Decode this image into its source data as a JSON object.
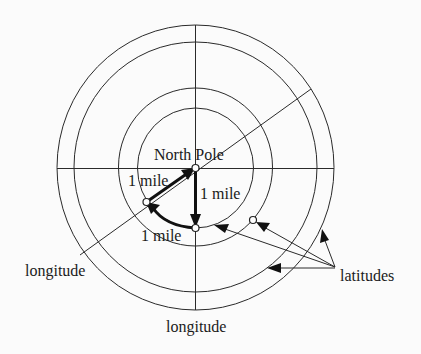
{
  "diagram": {
    "labels": {
      "north_pole": "North Pole",
      "segment_left": "1 mile",
      "segment_right": "1 mile",
      "segment_bottom": "1 mile",
      "longitude_left": "longitude",
      "longitude_bottom": "longitude",
      "latitudes": "latitudes"
    },
    "colors": {
      "background": "#fbfbfb",
      "stroke": "#2a2a2a",
      "path": "#111111"
    },
    "circles_count": 4,
    "path_description": "Triangle path: from pole 1 mile south, 1 mile west along latitude, 1 mile back north to pole"
  }
}
